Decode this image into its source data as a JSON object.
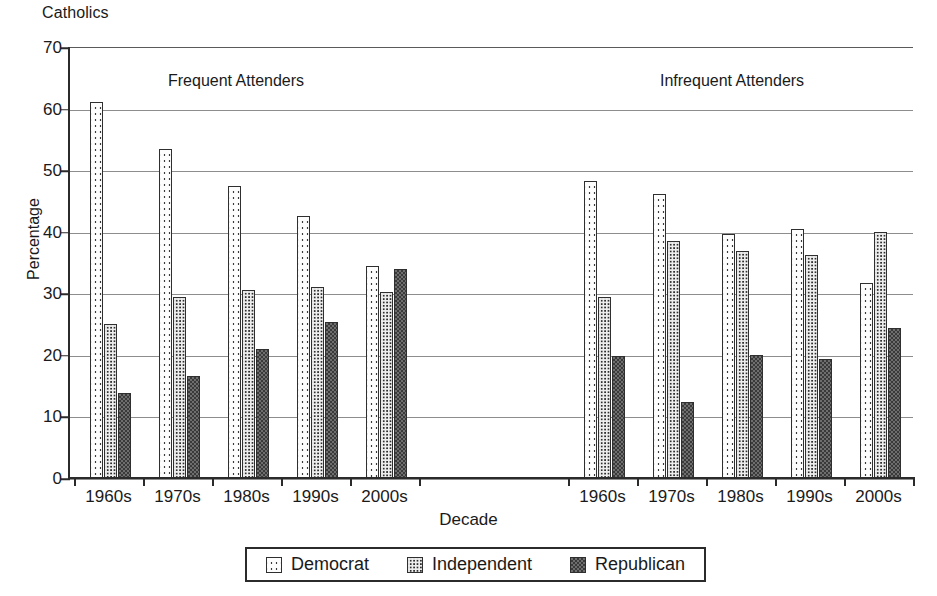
{
  "header": {
    "corner_title": "Catholics"
  },
  "axes": {
    "ylabel": "Percentage",
    "xlabel": "Decade",
    "yticks": [
      "70",
      "60",
      "50",
      "40",
      "30",
      "20",
      "10",
      "0"
    ]
  },
  "sections": [
    {
      "caption": "Frequent Attenders"
    },
    {
      "caption": "Infrequent Attenders"
    }
  ],
  "legend": {
    "items": [
      {
        "label": "Democrat",
        "swatch": "democrat-swatch"
      },
      {
        "label": "Independent",
        "swatch": "independent-swatch"
      },
      {
        "label": "Republican",
        "swatch": "republican-swatch"
      }
    ]
  },
  "chart_data": {
    "type": "bar",
    "title": "Catholics",
    "subtitle": "",
    "xlabel": "Decade",
    "ylabel": "Percentage",
    "ylim": [
      0,
      70
    ],
    "ytick_step": 10,
    "grid": true,
    "legend_position": "bottom",
    "panels": [
      {
        "name": "Frequent Attenders",
        "categories": [
          "1960s",
          "1970s",
          "1980s",
          "1990s",
          "2000s"
        ],
        "series": [
          {
            "name": "Democrat",
            "values": [
              61.0,
              53.5,
              47.5,
              42.5,
              34.5
            ]
          },
          {
            "name": "Independent",
            "values": [
              25.0,
              29.4,
              30.5,
              31.0,
              30.2
            ]
          },
          {
            "name": "Republican",
            "values": [
              13.8,
              16.5,
              21.0,
              25.4,
              33.9
            ]
          }
        ]
      },
      {
        "name": "Infrequent Attenders",
        "categories": [
          "1960s",
          "1970s",
          "1980s",
          "1990s",
          "2000s"
        ],
        "series": [
          {
            "name": "Democrat",
            "values": [
              48.2,
              46.1,
              39.7,
              40.5,
              31.6
            ]
          },
          {
            "name": "Independent",
            "values": [
              29.4,
              38.5,
              36.8,
              36.3,
              39.9
            ]
          },
          {
            "name": "Republican",
            "values": [
              19.8,
              12.4,
              20.0,
              19.4,
              24.3
            ]
          }
        ]
      }
    ],
    "series_colors": {
      "Democrat": "#fdfdfd",
      "Independent": "#ededed",
      "Republican": "#6e6e6e"
    }
  }
}
